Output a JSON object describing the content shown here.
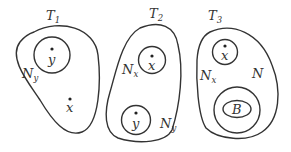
{
  "diagram": {
    "panels": [
      {
        "title": {
          "main": "T",
          "sub": "1"
        },
        "labels": [
          {
            "main": "N",
            "sub": "y"
          },
          {
            "main": "y"
          },
          {
            "main": "x"
          }
        ]
      },
      {
        "title": {
          "main": "T",
          "sub": "2"
        },
        "labels": [
          {
            "main": "N",
            "sub": "x"
          },
          {
            "main": "x"
          },
          {
            "main": "y"
          },
          {
            "main": "N",
            "sub": "y"
          }
        ]
      },
      {
        "title": {
          "main": "T",
          "sub": "3"
        },
        "labels": [
          {
            "main": "x"
          },
          {
            "main": "N",
            "sub": "x"
          },
          {
            "main": "N"
          },
          {
            "main": "B"
          }
        ]
      }
    ]
  }
}
